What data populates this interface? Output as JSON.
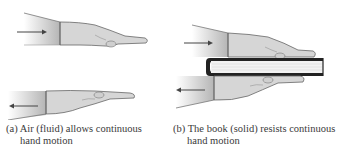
{
  "figure": {
    "panels": [
      {
        "id": "a",
        "label": "(a)",
        "caption_line1": "(a) Air (fluid) allows continuous",
        "caption_line2": "hand motion",
        "arrows": [
          "right",
          "left"
        ],
        "material": "Air (fluid)"
      },
      {
        "id": "b",
        "label": "(b)",
        "caption_line1": "(b) The book (solid) resists continuous",
        "caption_line2": "hand motion",
        "arrows": [
          "right",
          "left"
        ],
        "material": "Book (solid)"
      }
    ],
    "colors": {
      "sleeve": "#c8c8c8",
      "hand": "#d9d9d9",
      "outline": "#555555",
      "book_cover": "#222222",
      "book_pages": "#f2f2f2",
      "arrow": "#444444"
    }
  }
}
